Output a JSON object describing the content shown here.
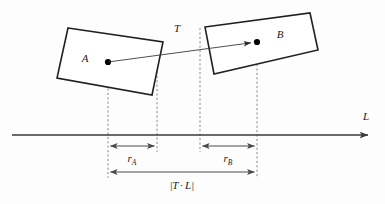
{
  "figure": {
    "background_color": "#fdfdfd",
    "stroke_color": "#231f20",
    "axis_color": "#3a3a3a",
    "guide_color": "#8a8a8a",
    "width": 385,
    "height": 204
  },
  "labels": {
    "box_a": "A",
    "box_b": "B",
    "vector_t": "T",
    "axis_l": "L",
    "radius_a_base": "r",
    "radius_a_sub": "A",
    "radius_b_base": "r",
    "radius_b_sub": "B",
    "separation_open": "|",
    "separation_t": "T",
    "separation_dot": "·",
    "separation_l": "L",
    "separation_close": "|"
  },
  "geometry": {
    "box_a": {
      "name": "A",
      "points": "68,28 163,42 152,95 57,78",
      "center": {
        "x": 108,
        "y": 62
      },
      "rotation_deg": 8.4
    },
    "box_b": {
      "name": "B",
      "points": "205,27 310,13 318,50 214,74",
      "center": {
        "x": 257,
        "y": 42
      },
      "rotation_deg": -7.6
    },
    "vector_t": {
      "from": {
        "x": 108,
        "y": 62
      },
      "to": {
        "x": 257,
        "y": 42
      },
      "label_pos": {
        "x": 177,
        "y": 32
      }
    },
    "axis_l": {
      "y": 135,
      "x_start": 12,
      "x_end": 370,
      "label_pos": {
        "x": 366,
        "y": 120
      }
    },
    "guides": [
      {
        "name": "guide-a-center",
        "x": 108,
        "y_top": 62,
        "y_bottom": 178
      },
      {
        "name": "guide-a-extent",
        "x": 157,
        "y_top": 45,
        "y_bottom": 152
      },
      {
        "name": "guide-b-extent",
        "x": 200,
        "y_top": 28,
        "y_bottom": 152
      },
      {
        "name": "guide-b-center",
        "x": 257,
        "y_top": 42,
        "y_bottom": 178
      }
    ],
    "measures": [
      {
        "name": "r-a",
        "x1": 108,
        "x2": 157,
        "y": 146,
        "label_x": 132,
        "label_y": 161
      },
      {
        "name": "r-b",
        "x1": 200,
        "x2": 257,
        "y": 146,
        "label_x": 228,
        "label_y": 161
      },
      {
        "name": "t-dot-l",
        "x1": 108,
        "x2": 257,
        "y": 172,
        "label_x": 182,
        "label_y": 189
      }
    ]
  }
}
